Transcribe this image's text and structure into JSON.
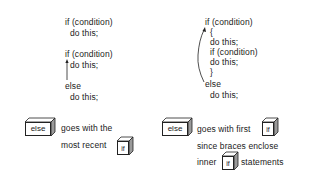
{
  "left_example": {
    "block1": {
      "line1": "if (condition)",
      "line2": "do this;"
    },
    "block2": {
      "line1": "if (condition)",
      "line2": "do this;",
      "line3": "else",
      "line4": "do this;"
    }
  },
  "right_example": {
    "line1": "if (condition)",
    "line2": "{",
    "line3": "do this;",
    "line4": "if (condition)",
    "line5": "do this;",
    "line6": "}",
    "line7": "else",
    "line8": "do this;"
  },
  "left_caption": {
    "else_box": "else",
    "text1": "goes with the",
    "text2": "most recent",
    "if_box": "if"
  },
  "right_caption": {
    "else_box": "else",
    "text1": "goes with first",
    "if_box1": "if",
    "text2": "since braces enclose",
    "text3": "inner",
    "if_box2": "if",
    "text4": "statements"
  }
}
